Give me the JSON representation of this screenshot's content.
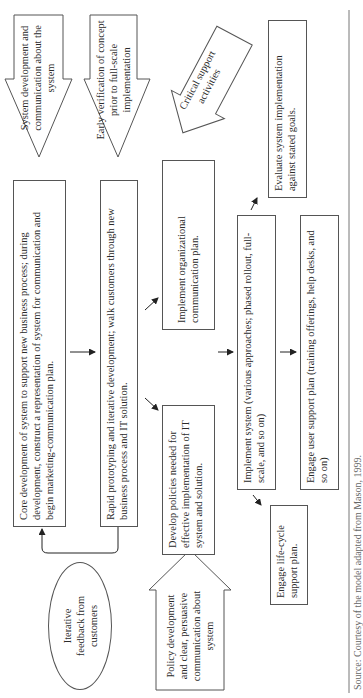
{
  "diagram": {
    "boxes": {
      "core_development": "Core development of system to support new business process; during development, construct a representation of system for communication and begin marketing-communication plan.",
      "rapid_prototyping": "Rapid prototyping and iterative development; walk customers through new business process and IT solution.",
      "develop_policies": "Develop policies needed for effective implementation of IT system and solution.",
      "implement_org_comm": "Implement organizational communication plan.",
      "implement_system": "Implement system (various approaches; phased rollout, full-scale, and so on)",
      "engage_user_support": "Engage user support plan (training offerings, help desks, and so on)",
      "evaluate": "Evaluate system implementation against stated goals.",
      "engage_lifecycle": "Engage life-cycle support plan."
    },
    "ellipse": {
      "feedback": "Iterative feedback from customers"
    },
    "block_arrows": {
      "system_dev_comm": "System development and communication about the system",
      "early_verification": "Early verification of concept prior to full-scale implementation",
      "critical_support": "Critical support activities",
      "policy_development": "Policy development and clear, persuasive communication about system"
    },
    "caption": "Source: Courtesy of the model adapted from Mason, 1999."
  }
}
